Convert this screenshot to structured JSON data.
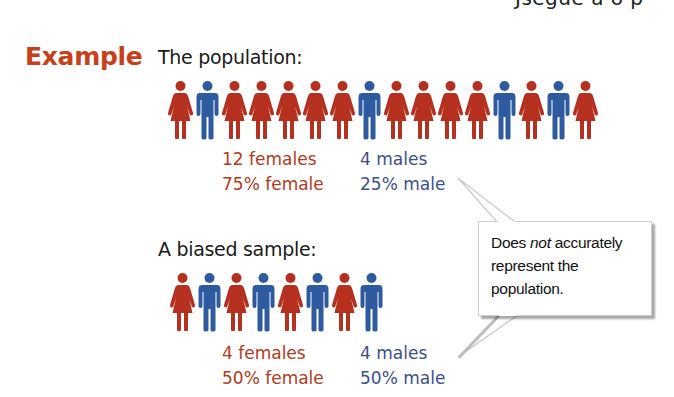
{
  "header": {
    "cut_text": "Jsegue a o p"
  },
  "example": {
    "label": "Example"
  },
  "population": {
    "heading": "The population:",
    "figures": [
      "F",
      "M",
      "F",
      "F",
      "F",
      "F",
      "F",
      "M",
      "F",
      "F",
      "F",
      "F",
      "M",
      "F",
      "M",
      "F"
    ],
    "females_count": "12 females",
    "males_count": "4 males",
    "female_pct": "75% female",
    "male_pct": "25% male"
  },
  "sample": {
    "heading": "A biased sample:",
    "figures": [
      "F",
      "M",
      "F",
      "M",
      "F",
      "M",
      "F",
      "M"
    ],
    "females_count": "4 females",
    "males_count": "4 males",
    "female_pct": "50% female",
    "male_pct": "50% male"
  },
  "callout": {
    "line1_pre": "Does ",
    "line1_em": "not",
    "line1_post": " accurately",
    "line2": "represent the",
    "line3": "population."
  },
  "colors": {
    "accent": "#c8401a",
    "female": "#b5301e",
    "male": "#2e5aa0",
    "female_text": "#b23a20",
    "male_text": "#3b4f8f"
  }
}
